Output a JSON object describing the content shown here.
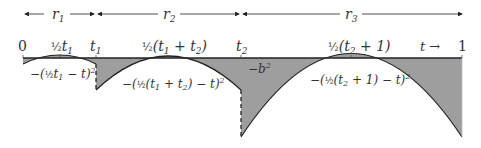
{
  "colors": {
    "fill": "#9e9e9e",
    "stroke": "#222222",
    "text": "#333333"
  },
  "ranges": [
    {
      "name": "r1",
      "label": "r",
      "sub": "1"
    },
    {
      "name": "r2",
      "label": "r",
      "sub": "2"
    },
    {
      "name": "r3",
      "label": "r",
      "sub": "3"
    }
  ],
  "ticks": {
    "zero": "0",
    "half_t1": {
      "frac": "½",
      "text": "t",
      "sub": "1"
    },
    "t1": {
      "text": "t",
      "sub": "1"
    },
    "half_t1_t2": {
      "frac": "½",
      "text": "(t",
      "sub1": "1",
      "mid": " + t",
      "sub2": "2",
      "end": ")"
    },
    "t2": {
      "text": "t",
      "sub": "2"
    },
    "half_t2_1": {
      "frac": "½",
      "text": "(t",
      "sub": "2",
      "end": " + 1)"
    },
    "t_arrow": "t →",
    "one": "1"
  },
  "curve_labels": {
    "c1": {
      "pre": "−(",
      "frac": "½",
      "t": "t",
      "sub": "1",
      "post": " − t)",
      "sup": "2"
    },
    "c2": {
      "pre": "−(",
      "frac": "½",
      "t": "(t",
      "sub1": "1",
      "mid": " + t",
      "sub2": "2",
      "post": ") − t)",
      "sup": "2"
    },
    "b2": {
      "pre": "−b",
      "sup": "2"
    },
    "c3": {
      "pre": "−(",
      "frac": "½",
      "t": "(t",
      "sub": "2",
      "post": " + 1) − t)",
      "sup": "2"
    }
  }
}
